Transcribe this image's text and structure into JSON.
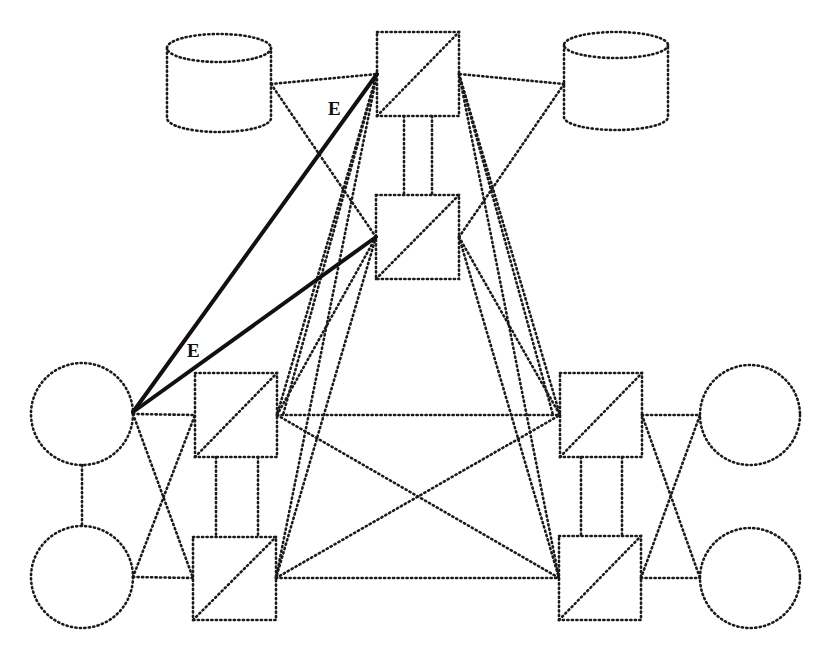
{
  "canvas": {
    "width": 825,
    "height": 654,
    "background": "#ffffff",
    "stroke_color": "#1a1a1a"
  },
  "nodes": {
    "cylinders": [
      {
        "id": "db-left",
        "x": 167,
        "y": 34,
        "w": 104,
        "h": 98,
        "ry": 14
      },
      {
        "id": "db-right",
        "x": 564,
        "y": 32,
        "w": 104,
        "h": 98,
        "ry": 13
      }
    ],
    "boxes": [
      {
        "id": "switch-top",
        "x": 377,
        "y": 32,
        "w": 82,
        "h": 84
      },
      {
        "id": "switch-mid",
        "x": 376,
        "y": 195,
        "w": 83,
        "h": 84
      },
      {
        "id": "switch-left-upper",
        "x": 195,
        "y": 373,
        "w": 82,
        "h": 84
      },
      {
        "id": "switch-left-lower",
        "x": 193,
        "y": 537,
        "w": 83,
        "h": 83
      },
      {
        "id": "switch-right-upper",
        "x": 560,
        "y": 373,
        "w": 82,
        "h": 84
      },
      {
        "id": "switch-right-lower",
        "x": 559,
        "y": 536,
        "w": 82,
        "h": 84
      }
    ],
    "circles": [
      {
        "id": "host-left-upper",
        "cx": 82,
        "cy": 414,
        "r": 51
      },
      {
        "id": "host-left-lower",
        "cx": 82,
        "cy": 577,
        "r": 51
      },
      {
        "id": "host-right-upper",
        "cx": 750,
        "cy": 415,
        "r": 50
      },
      {
        "id": "host-right-lower",
        "cx": 750,
        "cy": 578,
        "r": 50
      }
    ]
  },
  "links": {
    "dotted": [
      [
        271,
        84,
        377,
        74
      ],
      [
        271,
        84,
        376,
        237
      ],
      [
        564,
        84,
        459,
        74
      ],
      [
        564,
        84,
        459,
        237
      ],
      [
        404,
        116,
        404,
        195
      ],
      [
        432,
        116,
        432,
        195
      ],
      [
        377,
        74,
        277,
        415
      ],
      [
        377,
        74,
        276,
        578
      ],
      [
        459,
        74,
        560,
        415
      ],
      [
        459,
        74,
        559,
        578
      ],
      [
        376,
        237,
        277,
        415
      ],
      [
        376,
        237,
        276,
        578
      ],
      [
        459,
        237,
        560,
        415
      ],
      [
        459,
        237,
        559,
        578
      ],
      [
        377,
        74,
        283,
        415
      ],
      [
        459,
        74,
        553,
        415
      ],
      [
        277,
        415,
        560,
        415
      ],
      [
        276,
        578,
        559,
        578
      ],
      [
        277,
        415,
        559,
        578
      ],
      [
        276,
        578,
        560,
        415
      ],
      [
        216,
        457,
        216,
        537
      ],
      [
        258,
        457,
        258,
        537
      ],
      [
        581,
        457,
        581,
        536
      ],
      [
        622,
        457,
        622,
        536
      ],
      [
        133,
        414,
        195,
        415
      ],
      [
        133,
        577,
        193,
        578
      ],
      [
        133,
        414,
        193,
        578
      ],
      [
        133,
        577,
        195,
        415
      ],
      [
        82,
        465,
        82,
        526
      ],
      [
        642,
        415,
        700,
        415
      ],
      [
        641,
        578,
        700,
        578
      ],
      [
        642,
        415,
        700,
        578
      ],
      [
        641,
        578,
        700,
        415
      ]
    ],
    "solid": [
      [
        133,
        412,
        377,
        74
      ],
      [
        133,
        412,
        376,
        237
      ]
    ]
  },
  "labels": [
    {
      "id": "edge-label-upper",
      "text": "E",
      "x": 328,
      "y": 115
    },
    {
      "id": "edge-label-lower",
      "text": "E",
      "x": 187,
      "y": 357
    }
  ]
}
